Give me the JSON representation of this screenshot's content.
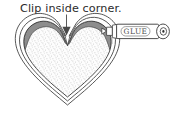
{
  "illustration": {
    "title": "Clip inside corner diagram",
    "caption": "Clip inside corner.",
    "glue_label": "GLUE",
    "colors": {
      "outline": "#3a3a3a",
      "shading": "#8d8d8d",
      "stipple": "#b9b9b9",
      "fill": "#fdfdfd",
      "background": "#ffffff",
      "caption_text": "#2b2b2b",
      "glue_text": "#4a4a4a",
      "arrow": "#5a5a5a"
    },
    "icons": {
      "arrow": "down-arrow-icon",
      "heart": "heart-shape-icon",
      "glue_tube": "glue-tube-icon",
      "notch": "v-notch-icon"
    },
    "parts": [
      {
        "name": "heart-fabric",
        "label": "heart fabric piece"
      },
      {
        "name": "seam-allowance",
        "label": "seam allowance outline"
      },
      {
        "name": "inside-corner-notch",
        "label": "clipped inside corner"
      },
      {
        "name": "glue-tube",
        "label": "glue tube"
      }
    ]
  }
}
